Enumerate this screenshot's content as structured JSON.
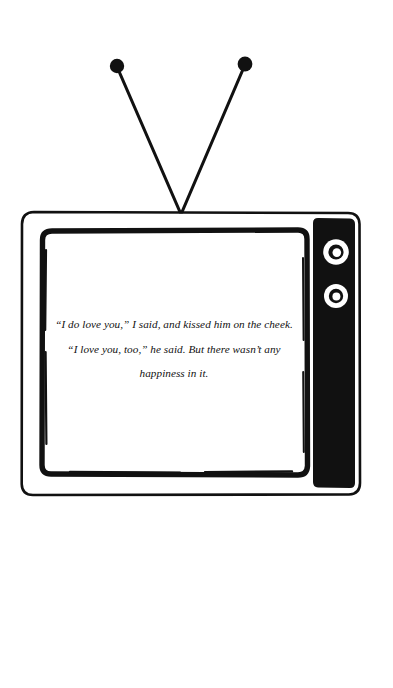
{
  "illustration": {
    "subject": "vintage-television-set",
    "style": "black-and-white-line-drawing",
    "background_color": "#ffffff",
    "ink_color": "#111111"
  },
  "antenna": {
    "name": "rabbit-ear-antenna",
    "left_rod": {
      "tip_x": 117,
      "tip_y": 66,
      "base_x": 181,
      "base_y": 213
    },
    "right_rod": {
      "tip_x": 245,
      "tip_y": 64,
      "base_x": 181,
      "base_y": 213
    },
    "tip_radius": 7,
    "rod_color": "#111111"
  },
  "tv": {
    "outer_frame": {
      "x": 22,
      "y": 212,
      "width": 338,
      "height": 283,
      "corner_radius": 12
    },
    "screen_bezel": {
      "x": 42,
      "y": 230,
      "width": 265,
      "height": 245,
      "corner_radius": 8
    },
    "screen": {
      "fill": "#ffffff"
    },
    "control_panel": {
      "x": 313,
      "y": 218,
      "width": 42,
      "height": 270,
      "fill": "#111111",
      "corner_radius": 5
    },
    "knobs": [
      {
        "label": "volume-knob",
        "cx": 336,
        "cy": 252,
        "outer_r": 13,
        "ring_r": 8,
        "inner_r": 4.5
      },
      {
        "label": "channel-knob",
        "cx": 336,
        "cy": 296,
        "outer_r": 12,
        "ring_r": 7.5,
        "inner_r": 4
      }
    ]
  },
  "screen_content": {
    "alignment": "center",
    "font_style": "italic-serif",
    "lines": [
      "“I do love you,” I said, and kissed him on the cheek.",
      "“I love you, too,” he said. But there wasn’t any",
      "happiness in it."
    ],
    "full_text": "“I do love you,” I said, and kissed him on the cheek. “I love you, too,” he said. But there wasn’t any happiness in it."
  }
}
